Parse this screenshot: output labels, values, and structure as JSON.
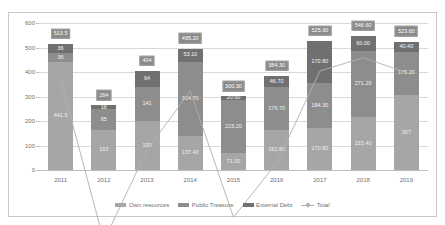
{
  "chart_data": {
    "type": "bar",
    "stacked": true,
    "title": "",
    "subtitle": "",
    "xlabel": "",
    "ylabel": "",
    "ylim": [
      0,
      600
    ],
    "yticks": [
      0,
      100,
      200,
      300,
      400,
      500,
      600
    ],
    "grid": true,
    "legend_position": "bottom",
    "categories": [
      "2011",
      "2012",
      "2013",
      "2014",
      "2015",
      "2016",
      "2017",
      "2018",
      "2019"
    ],
    "series": [
      {
        "name": "Own resources",
        "color": "#a6a6a6",
        "values": [
          441.5,
          163,
          199,
          137.4,
          71.0,
          162.8,
          170.8,
          215.4,
          307
        ],
        "labels": [
          "441.5",
          "163",
          "199",
          "137.40",
          "71.00",
          "162.80",
          "170.80",
          "215.40",
          "307"
        ]
      },
      {
        "name": "Public Treasure",
        "color": "#8d8d8d",
        "values": [
          36,
          85,
          141,
          304.7,
          215.2,
          176.7,
          184.3,
          271.2,
          176.2
        ],
        "labels": [
          "36",
          "85",
          "141",
          "304.70",
          "215.20",
          "176.70",
          "184.30",
          "271.20",
          "176.20"
        ]
      },
      {
        "name": "External Debt",
        "color": "#707070",
        "values": [
          36,
          16,
          64,
          53.1,
          14.1,
          44.8,
          170.8,
          60.0,
          40.4
        ],
        "labels": [
          "36",
          "16",
          "64",
          "53.10",
          "20.50",
          "46.70",
          "170.80",
          "60.00",
          "40.40"
        ]
      }
    ],
    "total_line": {
      "name": "Total",
      "color": "#b0b0b0",
      "values": [
        513.5,
        264,
        404,
        495.2,
        300.3,
        384.3,
        525.9,
        546.6,
        523.6
      ],
      "labels": [
        "513.5",
        "264",
        "404",
        "495.20",
        "300.30",
        "384.30",
        "525.90",
        "546.60",
        "523.60"
      ]
    }
  }
}
